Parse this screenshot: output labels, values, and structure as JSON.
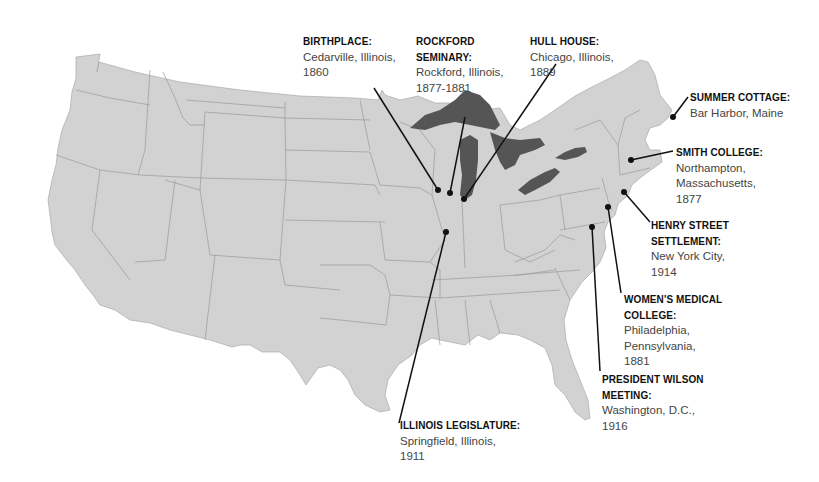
{
  "map": {
    "subject": "United States map — life locations",
    "colors": {
      "land": "#d2d2d2",
      "borders": "#9a9a9a",
      "lakes": "#555555",
      "background": "#ffffff",
      "leader_lines": "#111111",
      "markers": "#111111"
    }
  },
  "locations": [
    {
      "id": "birthplace",
      "title": "BIRTHPLACE:",
      "lines": [
        "Cedarville, Illinois,",
        "1860"
      ],
      "marker": [
        438,
        190
      ],
      "label_pos": [
        303,
        34
      ],
      "anchor": [
        374,
        88
      ]
    },
    {
      "id": "rockford",
      "title_lines": [
        "ROCKFORD",
        "SEMINARY:"
      ],
      "lines": [
        "Rockford, Illinois,",
        "1877-1881"
      ],
      "marker": [
        450,
        193
      ],
      "label_pos": [
        416,
        34
      ],
      "anchor": [
        465,
        117
      ]
    },
    {
      "id": "hull-house",
      "title": "HULL HOUSE:",
      "lines": [
        "Chicago, Illinois,",
        "1889"
      ],
      "marker": [
        464,
        199
      ],
      "label_pos": [
        530,
        34
      ],
      "anchor": [
        556,
        64
      ]
    },
    {
      "id": "summer-cottage",
      "title": "SUMMER COTTAGE:",
      "lines": [
        "Bar Harbor, Maine"
      ],
      "marker": [
        673,
        117
      ],
      "label_pos": [
        690,
        90
      ],
      "anchor": [
        688,
        97
      ]
    },
    {
      "id": "smith-college",
      "title": "SMITH COLLEGE:",
      "lines": [
        "Northampton,",
        "Massachusetts,",
        "1877"
      ],
      "marker": [
        631,
        160
      ],
      "label_pos": [
        676,
        145
      ],
      "anchor": [
        673,
        151
      ]
    },
    {
      "id": "henry-street",
      "title_lines": [
        "HENRY STREET",
        "SETTLEMENT:"
      ],
      "lines": [
        "New York City,",
        "1914"
      ],
      "marker": [
        624,
        192
      ],
      "label_pos": [
        651,
        218
      ],
      "anchor": [
        650,
        222
      ]
    },
    {
      "id": "womens-medical",
      "title_lines": [
        "WOMEN'S MEDICAL",
        "COLLEGE:"
      ],
      "lines": [
        "Philadelphia,",
        "Pennsylvania,",
        "1881"
      ],
      "marker": [
        608,
        207
      ],
      "label_pos": [
        624,
        292
      ],
      "anchor": [
        621,
        293
      ]
    },
    {
      "id": "wilson",
      "title_lines": [
        "PRESIDENT WILSON",
        "MEETING:"
      ],
      "lines": [
        "Washington, D.C.,",
        "1916"
      ],
      "marker": [
        592,
        227
      ],
      "label_pos": [
        602,
        372
      ],
      "anchor": [
        600,
        371
      ]
    },
    {
      "id": "legislature",
      "title": "ILLINOIS LEGISLATURE:",
      "lines": [
        "Springfield, Illinois,",
        "1911"
      ],
      "marker": [
        446,
        232
      ],
      "label_pos": [
        400,
        418
      ],
      "anchor": [
        399,
        423
      ]
    }
  ]
}
